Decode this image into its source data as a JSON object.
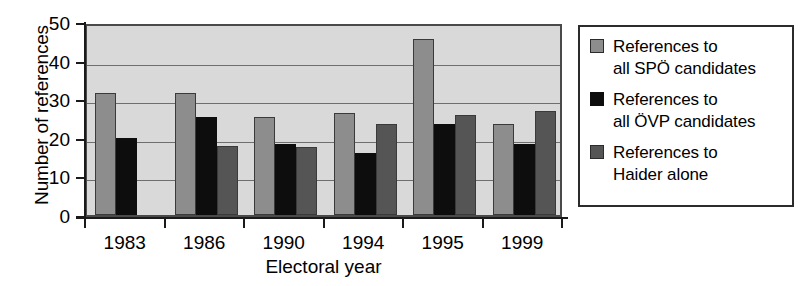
{
  "chart_data": {
    "type": "bar",
    "title": "",
    "xlabel": "Electoral year",
    "ylabel": "Number of references",
    "categories": [
      "1983",
      "1986",
      "1990",
      "1994",
      "1995",
      "1999"
    ],
    "series": [
      {
        "name": "References to\nall SPÖ candidates",
        "color": "#8d8d8d",
        "values": [
          31.5,
          31.5,
          25.5,
          26.5,
          45.5,
          23.5
        ]
      },
      {
        "name": "References to\nall ÖVP candidates",
        "color": "#0d0d0d",
        "values": [
          20,
          25.5,
          18.5,
          16,
          23.5,
          18.5
        ]
      },
      {
        "name": "References to\nHaider alone",
        "color": "#555555",
        "values": [
          0,
          18,
          17.5,
          23.5,
          26,
          27
        ]
      }
    ],
    "ylim": [
      0,
      50
    ],
    "yticks": [
      0,
      10,
      20,
      30,
      40,
      50
    ],
    "ytick_labels": [
      "0",
      "10",
      "20",
      "30",
      "40",
      "50"
    ],
    "grid": true,
    "legend_position": "right",
    "plot_background": "#d9d9d9"
  },
  "legend": {
    "items": [
      {
        "label": "References to\nall SPÖ candidates"
      },
      {
        "label": "References to\nall ÖVP candidates"
      },
      {
        "label": "References to\nHaider alone"
      }
    ]
  },
  "axes": {
    "y_title": "Number of references",
    "x_title": "Electoral year"
  }
}
